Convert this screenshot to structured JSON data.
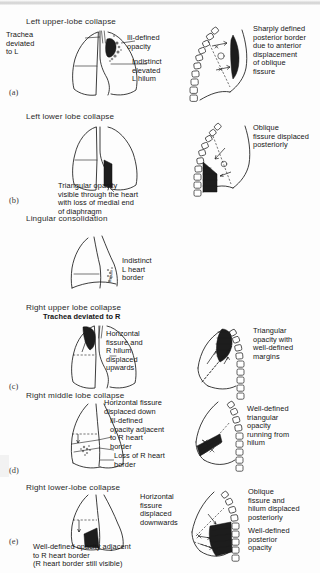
{
  "figure": {
    "title_implicit": "Patterns of lobar collapse on chest radiographs",
    "panels": [
      {
        "letter": "(a)",
        "heading": "Left upper-lobe collapse",
        "frontal_labels": [
          {
            "name": "trachea-deviated-left",
            "text": "Trachea\ndeviated\nto L"
          },
          {
            "name": "ill-defined-opacity",
            "text": "Ill-defined\nopacity"
          },
          {
            "name": "indistinct-elevated-l-hilum",
            "text": "Indistinct\nelevated\nL hilum"
          }
        ],
        "lateral_labels": [
          {
            "name": "sharply-defined-posterior-border",
            "text": "Sharply defined\nposterior border\ndue to anterior\ndisplacement\nof oblique\nfissure"
          }
        ]
      },
      {
        "letter": "(b)",
        "heading": "Left lower lobe collapse",
        "frontal_labels": [
          {
            "name": "triangular-opacity-through-heart",
            "text": "Triangular opacity\nvisible through the heart\nwith loss of medial end\nof diaphragm"
          }
        ],
        "lateral_labels": [
          {
            "name": "oblique-fissure-displaced-posteriorly",
            "text": "Oblique\nfissure displaced\nposteriorly"
          }
        ]
      },
      {
        "letter": "",
        "heading": "Lingular consolidation",
        "frontal_labels": [
          {
            "name": "indistinct-l-heart-border",
            "text": "Indistinct\nL heart\nborder"
          },
          {
            "name": "lingula-marking",
            "text": "lingula"
          }
        ],
        "lateral_labels": []
      },
      {
        "letter": "(c)",
        "heading": "Right upper lobe collapse",
        "frontal_labels": [
          {
            "name": "trachea-deviated-right",
            "text": "Trachea deviated to R"
          },
          {
            "name": "horizontal-fissure-displaced-upwards",
            "text": "Horizontal\nfissure and\nR hilum\ndisplaced\nupwards"
          }
        ],
        "lateral_labels": [
          {
            "name": "triangular-opacity-well-defined-margins",
            "text": "Triangular\nopacity with\nwell-defined\nmargins"
          }
        ]
      },
      {
        "letter": "(d)",
        "heading": "Right middle lobe collapse",
        "frontal_labels": [
          {
            "name": "horizontal-fissure-displaced-down",
            "text": "Horizontal fissure\ndisplaced down"
          },
          {
            "name": "ill-defined-opacity-adjacent-r-heart",
            "text": "Ill-defined\nopacity adjacent\nto R heart\nborder"
          },
          {
            "name": "loss-of-r-heart-border",
            "text": "Loss of R heart\nborder"
          }
        ],
        "lateral_labels": [
          {
            "name": "well-defined-triangular-opacity-from-hilum",
            "text": "Well-defined\ntriangular\nopacity\nrunning from\nhilum"
          }
        ]
      },
      {
        "letter": "(e)",
        "heading": "Right lower-lobe collapse",
        "frontal_labels": [
          {
            "name": "horizontal-fissure-displaced-downwards",
            "text": "Horizontal\nfissure\ndisplaced\ndownwards"
          },
          {
            "name": "well-defined-opacity-adjacent-r-heart",
            "text": "Well-defined opacity adjacent\nto R heart border\n(R heart border still visible)"
          }
        ],
        "lateral_labels": [
          {
            "name": "oblique-fissure-hilum-displaced-posteriorly",
            "text": "Oblique\nfissure and\nhilum displaced\nposteriorly"
          },
          {
            "name": "well-defined-posterior-opacity",
            "text": "Well-defined\nposterior\nopacity"
          }
        ]
      }
    ],
    "colors": {
      "ink": "#1b1b1b",
      "opacity_fill": "#1d1d1d",
      "paper": "#fdfdfd"
    }
  }
}
